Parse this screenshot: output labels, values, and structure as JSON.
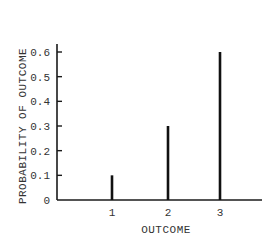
{
  "chart_data": {
    "type": "bar",
    "style": "stem",
    "categories": [
      "1",
      "2",
      "3"
    ],
    "values": [
      0.1,
      0.3,
      0.6
    ],
    "title": "",
    "xlabel": "OUTCOME",
    "ylabel": "PROBABILITY OF OUTCOME",
    "ylim": [
      0,
      0.6
    ],
    "yticks": [
      "0",
      "0.1",
      "0.2",
      "0.3",
      "0.4",
      "0.5",
      "0.6"
    ],
    "xticks": [
      "1",
      "2",
      "3"
    ],
    "grid": false,
    "legend": null
  },
  "colors": {
    "axis": "#1a1a1a",
    "bar": "#111111",
    "text": "#333333"
  }
}
